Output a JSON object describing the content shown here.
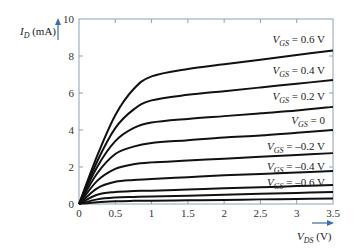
{
  "chart_data": {
    "type": "line",
    "title": "",
    "xlabel": "V_DS (V)",
    "ylabel": "I_D (mA)",
    "xlim": [
      0,
      3.5
    ],
    "ylim": [
      0,
      10
    ],
    "x_ticks": [
      0,
      0.5,
      1,
      1.5,
      2,
      2.5,
      3,
      3.5
    ],
    "x_tick_labels": [
      "0",
      "0.5",
      "1",
      "1.5",
      "2",
      "2.5",
      "3",
      "3.5"
    ],
    "y_ticks": [
      0,
      2,
      4,
      6,
      8,
      10
    ],
    "y_tick_labels": [
      "0",
      "2",
      "4",
      "6",
      "8",
      "10"
    ],
    "grid": false,
    "legend": "inline labels at right end of curves",
    "x": [
      0,
      0.25,
      0.5,
      0.75,
      1.0,
      1.5,
      2.0,
      2.5,
      3.0,
      3.5
    ],
    "series": [
      {
        "name": "V_GS = 0.6 V",
        "label": "0.6 V",
        "values": [
          0,
          2.6,
          4.8,
          6.2,
          6.9,
          7.3,
          7.55,
          7.8,
          8.05,
          8.3
        ]
      },
      {
        "name": "V_GS = 0.4 V",
        "label": "0.4 V",
        "values": [
          0,
          2.3,
          4.1,
          5.1,
          5.6,
          5.9,
          6.1,
          6.3,
          6.5,
          6.7
        ]
      },
      {
        "name": "V_GS = 0.2 V",
        "label": "0.2 V",
        "values": [
          0,
          2.0,
          3.4,
          4.1,
          4.4,
          4.6,
          4.75,
          4.9,
          5.05,
          5.25
        ]
      },
      {
        "name": "V_GS = 0",
        "label": "0",
        "values": [
          0,
          1.65,
          2.7,
          3.1,
          3.3,
          3.45,
          3.6,
          3.7,
          3.85,
          4.0
        ]
      },
      {
        "name": "V_GS = -0.2 V",
        "label": "-0.2 V",
        "values": [
          0,
          1.25,
          1.9,
          2.15,
          2.25,
          2.35,
          2.45,
          2.55,
          2.65,
          2.75
        ]
      },
      {
        "name": "V_GS = -0.4 V",
        "label": "-0.4 V",
        "values": [
          0,
          0.85,
          1.2,
          1.3,
          1.35,
          1.45,
          1.55,
          1.62,
          1.7,
          1.78
        ]
      },
      {
        "name": "V_GS = -0.6 V",
        "label": "-0.6 V",
        "values": [
          0,
          0.5,
          0.65,
          0.7,
          0.72,
          0.78,
          0.85,
          0.9,
          0.97,
          1.03
        ]
      },
      {
        "name": "(unlabeled)",
        "label": "",
        "values": [
          0,
          0.25,
          0.35,
          0.38,
          0.4,
          0.45,
          0.5,
          0.55,
          0.6,
          0.65
        ]
      },
      {
        "name": "(unlabeled)",
        "label": "",
        "values": [
          0,
          0.1,
          0.15,
          0.17,
          0.18,
          0.2,
          0.22,
          0.25,
          0.27,
          0.3
        ]
      }
    ]
  },
  "labels": {
    "y_axis_main": "I",
    "y_axis_sub": "D",
    "y_axis_unit": " (mA)",
    "x_axis_main": "V",
    "x_axis_sub": "DS",
    "x_axis_unit": " (V)",
    "curve_prefix": "V",
    "curve_sub": "GS"
  },
  "colors": {
    "axis": "#8aa3b8",
    "curve": "#111111",
    "arrow": "#3a6fa8"
  }
}
